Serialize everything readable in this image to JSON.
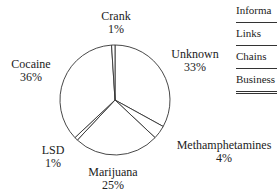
{
  "chart_data": {
    "type": "pie",
    "title": "",
    "categories": [
      "Unknown",
      "Methamphetamines",
      "Marijuana",
      "LSD",
      "Cocaine",
      "Crank"
    ],
    "values": [
      33,
      4,
      25,
      1,
      36,
      1
    ],
    "labels": {
      "unknown": {
        "name": "Unknown",
        "pct": "33%"
      },
      "meth": {
        "name": "Methamphetamines",
        "pct": "4%"
      },
      "marijuana": {
        "name": "Marijuana",
        "pct": "25%"
      },
      "lsd": {
        "name": "LSD",
        "pct": "1%"
      },
      "cocaine": {
        "name": "Cocaine",
        "pct": "36%"
      },
      "crank": {
        "name": "Crank",
        "pct": "1%"
      }
    },
    "legend": "none",
    "grid": false
  },
  "side_menu": {
    "items": [
      "Informa",
      "Links",
      "Chains",
      "Business"
    ]
  }
}
